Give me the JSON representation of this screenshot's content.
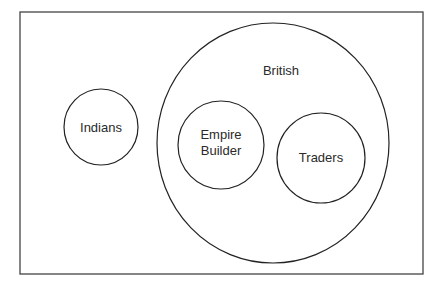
{
  "diagram": {
    "type": "euler-venn",
    "frame": {
      "x": 20,
      "y": 12,
      "width": 403,
      "height": 262
    },
    "circles": [
      {
        "id": "indians",
        "label": "Indians",
        "cx": 101,
        "cy": 127,
        "rx": 37,
        "ry": 38
      },
      {
        "id": "british",
        "label": "British",
        "cx": 273,
        "cy": 143,
        "rx": 116,
        "ry": 120
      },
      {
        "id": "empire-builder",
        "label_line1": "Empire",
        "label_line2": "Builder",
        "cx": 221,
        "cy": 145,
        "rx": 43,
        "ry": 44
      },
      {
        "id": "traders",
        "label": "Traders",
        "cx": 321,
        "cy": 158,
        "rx": 44,
        "ry": 45
      }
    ],
    "stroke_color": "#222222",
    "background": "#ffffff"
  }
}
